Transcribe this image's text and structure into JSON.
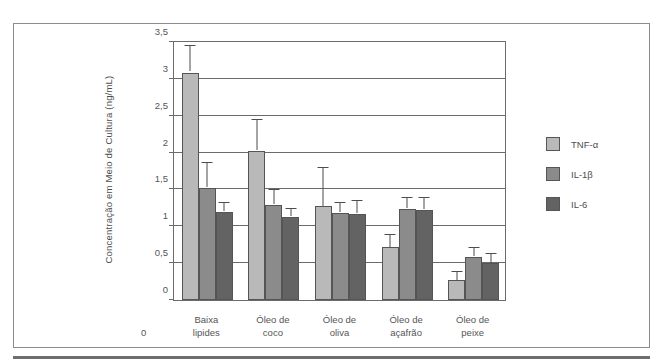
{
  "chart_data": {
    "type": "bar",
    "title": "",
    "subtitle": "",
    "xlabel": "",
    "ylabel": "Concentração em Meio de Cultura (ng/mL)",
    "ylim": [
      0,
      3.5
    ],
    "ytick_values": [
      0,
      0.5,
      1,
      1.5,
      2,
      2.5,
      3,
      3.5
    ],
    "ytick_labels": [
      "0",
      "0,5",
      "1",
      "1,5",
      "2",
      "2,5",
      "3",
      "3,5"
    ],
    "grid": true,
    "grid_axis": "y",
    "legend_position": "right",
    "x_origin_label": "0",
    "categories": [
      "Baixa lipides",
      "Óleo de coco",
      "Óleo de oliva",
      "Óleo de açafrão",
      "Óleo de peixe"
    ],
    "category_lines": [
      [
        "Baixa",
        "lipides"
      ],
      [
        "Óleo de",
        "coco"
      ],
      [
        "Óleo de",
        "oliva"
      ],
      [
        "Óleo de",
        "açafrão"
      ],
      [
        "Óleo de",
        "peixe"
      ]
    ],
    "series": [
      {
        "name": "TNF-α",
        "color": "#b9b9b9",
        "values": [
          3.08,
          2.02,
          1.27,
          0.72,
          0.27
        ],
        "errors": [
          0.34,
          0.4,
          0.51,
          0.15,
          0.11
        ]
      },
      {
        "name": "IL-1β",
        "color": "#8b8b8b",
        "values": [
          1.52,
          1.29,
          1.18,
          1.24,
          0.59
        ],
        "errors": [
          0.33,
          0.19,
          0.13,
          0.13,
          0.11
        ]
      },
      {
        "name": "IL-6",
        "color": "#636363",
        "values": [
          1.2,
          1.13,
          1.17,
          1.22,
          0.5
        ],
        "errors": [
          0.11,
          0.09,
          0.16,
          0.16,
          0.12
        ]
      }
    ]
  },
  "legend": {
    "items": [
      {
        "label": "TNF-α",
        "swatch": "light-gray"
      },
      {
        "label": "IL-1β",
        "swatch": "medium-gray"
      },
      {
        "label": "IL-6",
        "swatch": "dark-gray"
      }
    ]
  },
  "colors": {
    "series_1": "#b9b9b9",
    "series_2": "#8b8b8b",
    "series_3": "#636363",
    "axis": "#6b6b6b",
    "text": "#4d4d4d",
    "frame": "#8c8c8c",
    "rule": "#6f6f6f"
  }
}
